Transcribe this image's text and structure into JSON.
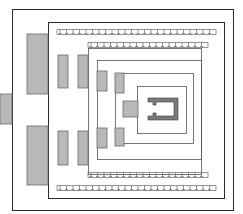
{
  "diagram": {
    "type": "architectural-floor-plan",
    "colors": {
      "wall": "#2a2a2a",
      "pylon_fill": "#b9b9b9",
      "sanctum_fill": "#7a7a7a",
      "background": "#ffffff"
    },
    "enclosures": [
      {
        "name": "outer-enclosure-wall",
        "x": 12,
        "y": 9,
        "w": 221,
        "h": 201
      },
      {
        "name": "second-enclosure-wall",
        "x": 48,
        "y": 22,
        "w": 176,
        "h": 176
      },
      {
        "name": "third-enclosure-wall",
        "x": 88,
        "y": 48,
        "w": 113,
        "h": 126
      },
      {
        "name": "fourth-enclosure-wall",
        "x": 97,
        "y": 60,
        "w": 104,
        "h": 99
      },
      {
        "name": "fifth-enclosure-wall",
        "x": 115,
        "y": 73,
        "w": 78,
        "h": 70
      },
      {
        "name": "inner-sanctum-wall",
        "x": 137,
        "y": 86,
        "w": 49,
        "h": 47
      }
    ],
    "dentil_rows": [
      {
        "name": "dentil-row-top-outer",
        "x1": 57,
        "x2": 216,
        "y": 29
      },
      {
        "name": "dentil-row-top-inner",
        "x1": 88,
        "x2": 208,
        "y": 42
      },
      {
        "name": "dentil-row-bottom-inner",
        "x1": 88,
        "x2": 208,
        "y": 172
      },
      {
        "name": "dentil-row-bottom-outer",
        "x1": 57,
        "x2": 216,
        "y": 185
      }
    ],
    "pylons": [
      {
        "name": "approach-block",
        "x": 0,
        "y": 94,
        "w": 12,
        "h": 30
      },
      {
        "name": "main-gate-north",
        "x": 27,
        "y": 34,
        "w": 21,
        "h": 60
      },
      {
        "name": "main-gate-south",
        "x": 27,
        "y": 126,
        "w": 21,
        "h": 59
      },
      {
        "name": "second-pylon-north",
        "x": 58,
        "y": 55,
        "w": 10,
        "h": 33
      },
      {
        "name": "second-pylon-south",
        "x": 58,
        "y": 131,
        "w": 10,
        "h": 34
      },
      {
        "name": "third-pylon-north",
        "x": 78,
        "y": 55,
        "w": 10,
        "h": 33
      },
      {
        "name": "third-pylon-south",
        "x": 78,
        "y": 131,
        "w": 10,
        "h": 34
      },
      {
        "name": "fourth-pylon-north",
        "x": 97,
        "y": 71,
        "w": 10,
        "h": 20
      },
      {
        "name": "fourth-pylon-south",
        "x": 97,
        "y": 128,
        "w": 10,
        "h": 20
      },
      {
        "name": "fifth-pylon-north",
        "x": 115,
        "y": 73,
        "w": 9,
        "h": 20
      },
      {
        "name": "fifth-pylon-south",
        "x": 115,
        "y": 128,
        "w": 9,
        "h": 18
      },
      {
        "name": "vestibule-block",
        "x": 123,
        "y": 101,
        "w": 15,
        "h": 16
      }
    ],
    "sanctum_shrine": {
      "x": 148,
      "y": 98,
      "w": 30,
      "h": 22,
      "thickness": 4,
      "opening": "west"
    }
  }
}
